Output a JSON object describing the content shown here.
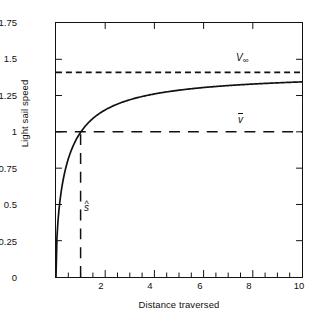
{
  "chart_data": {
    "type": "line",
    "title": "",
    "xlabel": "Distance traversed",
    "ylabel": "Light sail speed",
    "xlim": [
      0,
      10
    ],
    "ylim": [
      0,
      1.75
    ],
    "grid": false,
    "legend": "none",
    "xticks": [
      {
        "value": 2,
        "label": "2"
      },
      {
        "value": 4,
        "label": "4"
      },
      {
        "value": 6,
        "label": "6"
      },
      {
        "value": 8,
        "label": "8"
      },
      {
        "value": 10,
        "label": "10"
      }
    ],
    "yticks": [
      {
        "value": 0,
        "label": "0"
      },
      {
        "value": 0.25,
        "label": "0.25"
      },
      {
        "value": 0.5,
        "label": "0.5"
      },
      {
        "value": 0.75,
        "label": "0.75"
      },
      {
        "value": 1,
        "label": "1"
      },
      {
        "value": 1.25,
        "label": "1.25"
      },
      {
        "value": 1.5,
        "label": "1.5"
      },
      {
        "value": 1.75,
        "label": "1.75"
      }
    ],
    "series": [
      {
        "name": "light sail speed curve",
        "style": "solid",
        "color": "#111111",
        "x": [
          0,
          0.05,
          0.1,
          0.15,
          0.2,
          0.3,
          0.4,
          0.5,
          0.6,
          0.7,
          0.8,
          0.9,
          1.0,
          1.2,
          1.4,
          1.6,
          1.8,
          2.0,
          2.5,
          3.0,
          3.5,
          4.0,
          4.5,
          5.0,
          5.5,
          6.0,
          6.5,
          7.0,
          7.5,
          8.0,
          8.5,
          9.0,
          9.5,
          10.0
        ],
        "y": [
          0,
          0.313,
          0.435,
          0.524,
          0.595,
          0.707,
          0.794,
          0.866,
          0.926,
          0.98,
          1.029,
          1.073,
          1.114,
          1.187,
          1.248,
          1.3,
          1.345,
          1.385,
          1.462,
          1.52,
          1.565,
          1.6,
          1.628,
          1.651,
          1.67,
          1.686,
          1.699,
          1.71,
          1.72,
          1.728,
          1.735,
          1.741,
          1.746,
          1.751
        ],
        "y_scaled_note": "curve plotted as V_inf*sqrt(s/(s+1)) reaching ~1.39 at s=10"
      },
      {
        "name": "terminal speed asymptote",
        "style": "dashed-short",
        "color": "#111111",
        "type": "hline",
        "value": 1.41,
        "label": "V∞"
      },
      {
        "name": "characteristic speed",
        "style": "dashed-long",
        "color": "#111111",
        "type": "hline",
        "value": 1.0,
        "label": "v̄"
      },
      {
        "name": "characteristic distance",
        "style": "dashed-long",
        "color": "#111111",
        "type": "vline",
        "value": 1.0,
        "label": "ŝ",
        "y_from": 0,
        "y_to": 1.0
      }
    ],
    "annotations": [
      {
        "name": "v-infinity-label",
        "text_base": "V",
        "text_sub": "∞",
        "x": 7.4,
        "y": 1.47
      },
      {
        "name": "v-bar-label",
        "text_base": "v",
        "accent": "bar",
        "x": 7.4,
        "y": 1.06
      },
      {
        "name": "s-hat-label",
        "text_base": "s",
        "accent": "hat",
        "x": 1.15,
        "y": 0.36
      }
    ],
    "colors": {
      "axis": "#111111",
      "curve": "#111111",
      "background": "#ffffff"
    }
  }
}
